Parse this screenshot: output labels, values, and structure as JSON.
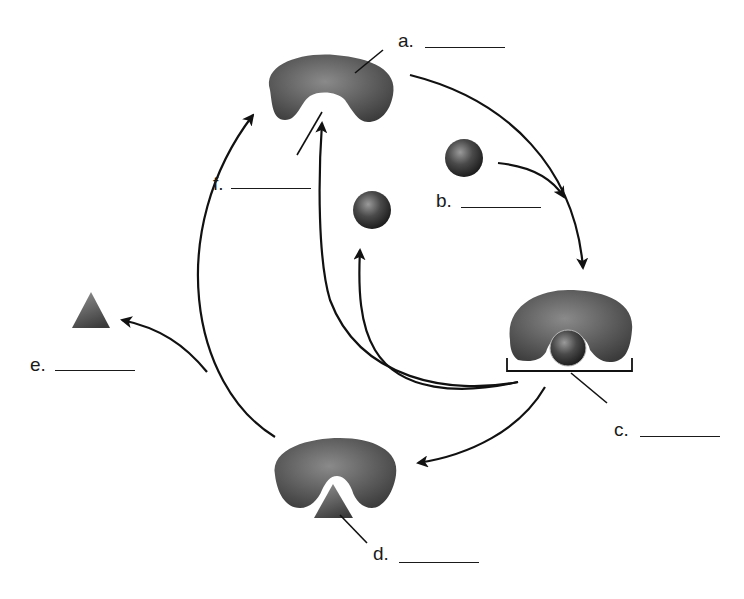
{
  "diagram": {
    "type": "enzyme catalytic cycle",
    "labels": {
      "a": {
        "letter": "a.",
        "blank": "",
        "points_to": "enzyme"
      },
      "b": {
        "letter": "b.",
        "blank": "",
        "points_to": "substrate"
      },
      "c": {
        "letter": "c.",
        "blank": "",
        "points_to": "enzyme-substrate complex"
      },
      "d": {
        "letter": "d.",
        "blank": "",
        "points_to": "product bound to enzyme"
      },
      "e": {
        "letter": "e.",
        "blank": "",
        "points_to": "released product"
      },
      "f": {
        "letter": "f.",
        "blank": "",
        "points_to": "active site"
      }
    },
    "colors": {
      "shape_dark": "#3a3a3a",
      "shape_light": "#8a8a8a",
      "line": "#111111",
      "background": "#ffffff"
    }
  }
}
